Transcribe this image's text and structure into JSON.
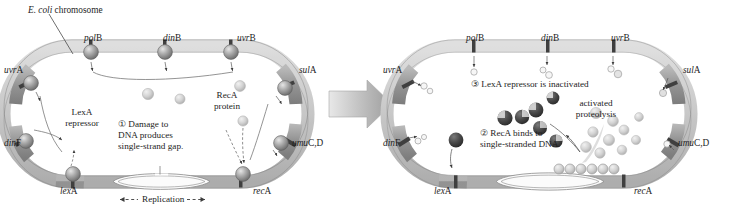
{
  "figure": {
    "title_annotation": "E. coli chromosome",
    "title_annotation_italic": "E. coli",
    "title_annotation_rest": " chromosome",
    "replication_label": "Replication",
    "transition_arrow": "block-arrow-right"
  },
  "colors": {
    "ring_band": "#d2d2d2",
    "ring_band_light": "#e3e3e3",
    "gene_segment": "#9a9a9a",
    "gene_marker_dark": "#4a4a4a",
    "bead": "#a8a8a8",
    "bead_dark": "#6f6f6f",
    "recA_protein": "#c9c9c9",
    "cleaved_lexA": "#3c3c3c",
    "arrow_gray": "#b5b5b5",
    "outline": "#6a6a6a",
    "text": "#1d1d1d"
  },
  "panels": [
    {
      "id": "before-sos",
      "name": "left-panel-uninduced",
      "genes": [
        {
          "name": "polB",
          "italic": "pol",
          "plain": "B",
          "x": 84,
          "y": 38,
          "anchor": "top"
        },
        {
          "name": "dinB",
          "italic": "din",
          "plain": "B",
          "x": 163,
          "y": 38,
          "anchor": "top"
        },
        {
          "name": "uvrB",
          "italic": "uvr",
          "plain": "B",
          "x": 237,
          "y": 38,
          "anchor": "top"
        },
        {
          "name": "uvrA",
          "italic": "uvr",
          "plain": "A",
          "x": 8,
          "y": 70,
          "anchor": "left"
        },
        {
          "name": "dinF",
          "italic": "din",
          "plain": "F",
          "x": 8,
          "y": 143,
          "anchor": "left"
        },
        {
          "name": "lexA",
          "italic": "lex",
          "plain": "A",
          "x": 63,
          "y": 192,
          "anchor": "bottom"
        },
        {
          "name": "recA",
          "italic": "rec",
          "plain": "A",
          "x": 254,
          "y": 192,
          "anchor": "bottom"
        },
        {
          "name": "sulA",
          "italic": "sul",
          "plain": "A",
          "x": 300,
          "y": 70,
          "anchor": "right"
        },
        {
          "name": "umuC,D",
          "italic": "umu",
          "plain": "C,D",
          "x": 296,
          "y": 143,
          "anchor": "right"
        }
      ],
      "annotations": [
        {
          "id": "lexA-repressor",
          "lines": [
            "LexA",
            "repressor"
          ],
          "x": 72,
          "y": 112
        },
        {
          "id": "recA-protein",
          "lines": [
            "RecA",
            "protein"
          ],
          "x": 209,
          "y": 95
        },
        {
          "id": "step-1",
          "step": "①",
          "lines": [
            "① Damage to",
            "DNA produces",
            "single-strand gap."
          ],
          "x": 121,
          "y": 123
        }
      ]
    },
    {
      "id": "after-sos",
      "name": "right-panel-induced",
      "genes": [
        {
          "name": "polB",
          "italic": "pol",
          "plain": "B",
          "x": 466,
          "y": 38,
          "anchor": "top"
        },
        {
          "name": "dinB",
          "italic": "din",
          "plain": "B",
          "x": 541,
          "y": 38,
          "anchor": "top"
        },
        {
          "name": "uvrB",
          "italic": "uvr",
          "plain": "B",
          "x": 613,
          "y": 38,
          "anchor": "top"
        },
        {
          "name": "uvrA",
          "italic": "uvr",
          "plain": "A",
          "x": 386,
          "y": 70,
          "anchor": "left"
        },
        {
          "name": "dinF",
          "italic": "din",
          "plain": "F",
          "x": 386,
          "y": 143,
          "anchor": "left"
        },
        {
          "name": "lexA",
          "italic": "lex",
          "plain": "A",
          "x": 437,
          "y": 192,
          "anchor": "bottom"
        },
        {
          "name": "recA",
          "italic": "rec",
          "plain": "A",
          "x": 635,
          "y": 192,
          "anchor": "bottom"
        },
        {
          "name": "sulA",
          "italic": "sul",
          "plain": "A",
          "x": 684,
          "y": 70,
          "anchor": "right"
        },
        {
          "name": "umuC,D",
          "italic": "umu",
          "plain": "C,D",
          "x": 680,
          "y": 143,
          "anchor": "right"
        }
      ],
      "annotations": [
        {
          "id": "step-3",
          "step": "③",
          "lines": [
            "③ LexA repressor is inactivated"
          ],
          "x": 474,
          "y": 83
        },
        {
          "id": "activated-proteolysis",
          "lines": [
            "activated",
            "proteolysis"
          ],
          "x": 574,
          "y": 101
        },
        {
          "id": "step-2",
          "step": "②",
          "lines": [
            "② RecA binds to",
            "single-stranded DNA."
          ],
          "x": 483,
          "y": 131
        }
      ]
    }
  ]
}
